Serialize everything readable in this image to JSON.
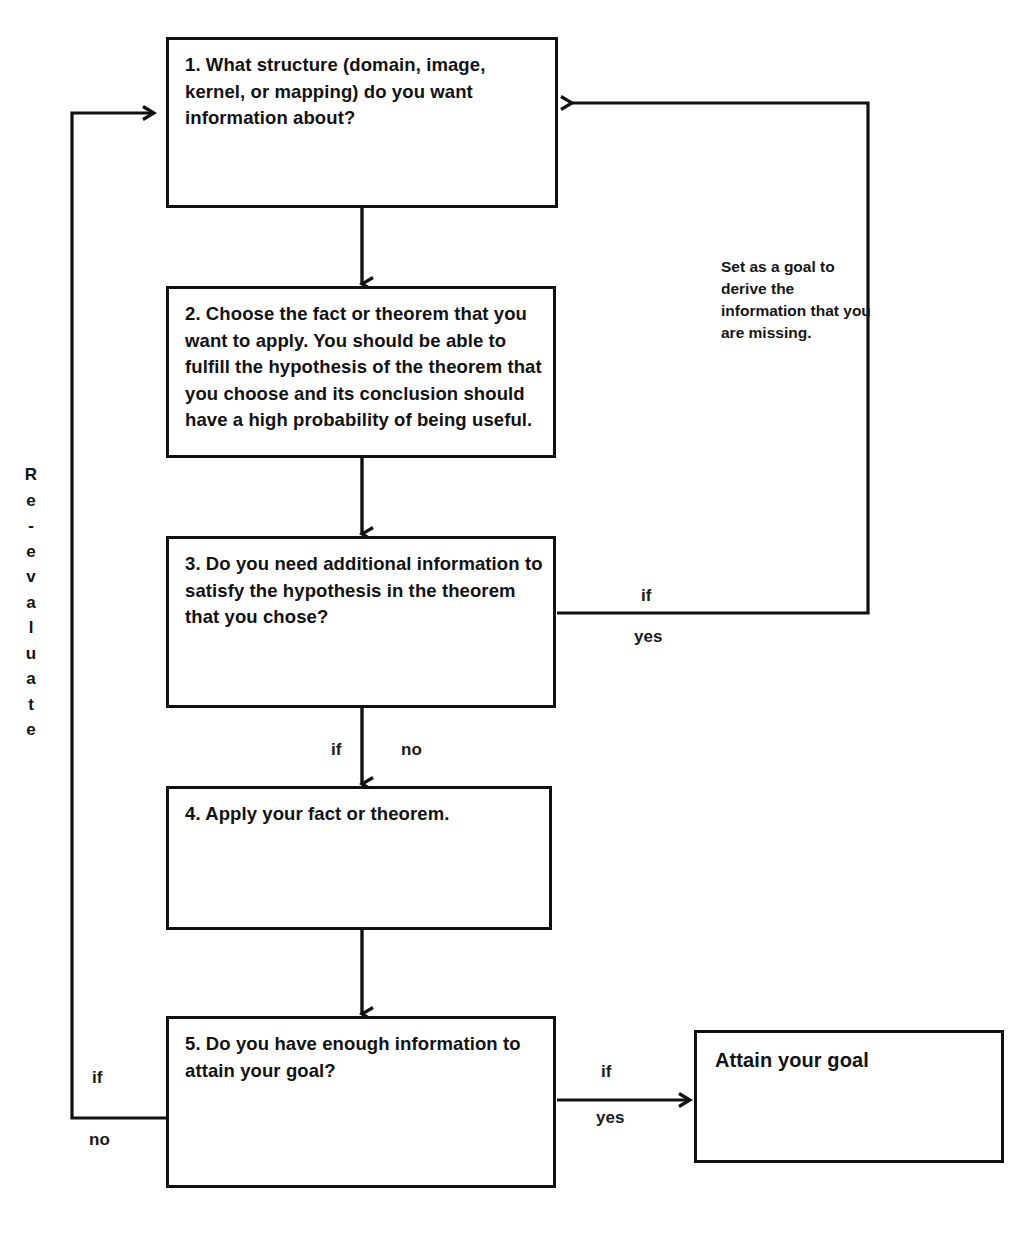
{
  "diagram": {
    "nodes": [
      {
        "id": "step1",
        "label": "1. What structure (domain, image, kernel, or mapping) do you want information about?"
      },
      {
        "id": "step2",
        "label": "2. Choose the fact or theorem that you want to apply. You should be able to fulfill the hypothesis of the theorem that you choose and its conclusion should have a high probability of being useful."
      },
      {
        "id": "step3",
        "label": "3. Do you need additional information to satisfy the hypothesis in the theorem that you chose?"
      },
      {
        "id": "step4",
        "label": "4. Apply your fact or theorem."
      },
      {
        "id": "step5",
        "label": "5. Do you have enough information to attain your goal?"
      },
      {
        "id": "goal",
        "label": "Attain your goal"
      }
    ],
    "edge_labels": {
      "step3_yes_if": "if",
      "step3_yes_value": "yes",
      "step3_no_if": "if",
      "step3_no_value": "no",
      "step5_no_if": "if",
      "step5_no_value": "no",
      "step5_yes_if": "if",
      "step5_yes_value": "yes"
    },
    "annotations": {
      "set_goal_note": "Set as a goal to derive the information that you are missing.",
      "reevaluate": "Re-evaluate",
      "reevaluate_chars": [
        "R",
        "e",
        "-",
        "e",
        "v",
        "a",
        "l",
        "u",
        "a",
        "t",
        "e"
      ]
    },
    "colors": {
      "stroke": "#111111",
      "background": "#ffffff",
      "text": "#121212"
    }
  }
}
